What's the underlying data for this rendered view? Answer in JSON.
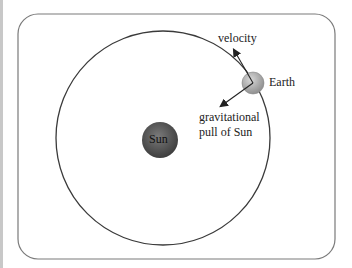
{
  "diagram": {
    "labels": {
      "velocity": "velocity",
      "earth": "Earth",
      "gravity_line1": "gravitational",
      "gravity_line2": "pull of Sun",
      "sun": "Sun"
    },
    "colors": {
      "frame": "#7a7a7a",
      "orbit": "#3a3a3a",
      "sun_fill": "#5a5a5a",
      "earth_fill": "#b0b0b0",
      "arrow": "#222222"
    }
  }
}
